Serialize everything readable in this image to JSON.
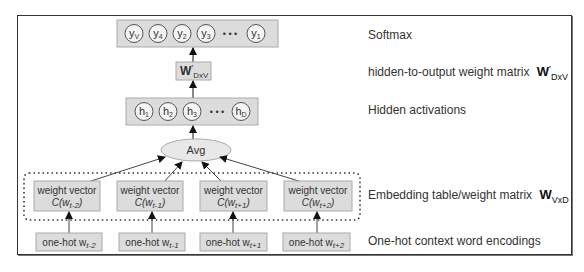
{
  "diagram": {
    "softmax_nodes": [
      "yV",
      "y4",
      "y2",
      "y3",
      "y1"
    ],
    "softmax_node_display": [
      {
        "main": "y",
        "sub": "V"
      },
      {
        "main": "y",
        "sub": "4"
      },
      {
        "main": "y",
        "sub": "2"
      },
      {
        "main": "y",
        "sub": "3"
      },
      {
        "main": "y",
        "sub": "1"
      }
    ],
    "ellipsis": "• • •",
    "output_matrix": {
      "main": "W",
      "prime": "'",
      "sub": "DxV"
    },
    "hidden_nodes": [
      {
        "main": "h",
        "sub": "1"
      },
      {
        "main": "h",
        "sub": "2"
      },
      {
        "main": "h",
        "sub": "3"
      },
      {
        "main": "h",
        "sub": "D"
      }
    ],
    "avg_label": "Avg",
    "weight_vectors": [
      {
        "line1": "weight vector",
        "pre": "C(w",
        "sub": "t-2",
        "post": ")"
      },
      {
        "line1": "weight vector",
        "pre": "C(w",
        "sub": "t-1",
        "post": ")"
      },
      {
        "line1": "weight vector",
        "pre": "C(w",
        "sub": "t+1",
        "post": ")"
      },
      {
        "line1": "weight vector",
        "pre": "C(w",
        "sub": "t+2",
        "post": ")"
      }
    ],
    "one_hot": [
      {
        "pre": "one-hot w",
        "sub": "t-2"
      },
      {
        "pre": "one-hot w",
        "sub": "t-1"
      },
      {
        "pre": "one-hot w",
        "sub": "t+1"
      },
      {
        "pre": "one-hot w",
        "sub": "t+2"
      }
    ]
  },
  "labels": {
    "softmax": "Softmax",
    "hidden_to_output": "hidden-to-output weight matrix",
    "hidden_to_output_sym": {
      "main": "W",
      "prime": "'",
      "sub": "DxV"
    },
    "hidden_activations": "Hidden activations",
    "embedding": "Embedding table/weight matrix",
    "embedding_sym": {
      "main": "W",
      "sub": "VxD"
    },
    "one_hot_context": "One-hot context word encodings"
  },
  "colors": {
    "box_fill": "#dcdcdc",
    "node_fill": "#f4f4f4",
    "frame": "#333333",
    "text": "#333333"
  }
}
